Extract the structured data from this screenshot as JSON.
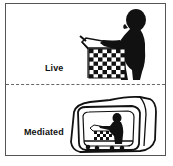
{
  "diagram": {
    "panels": [
      {
        "id": "live",
        "label": "Live",
        "illustration": "person-playing-chess-icon"
      },
      {
        "id": "mediated",
        "label": "Mediated",
        "illustration": "tv-screen-person-chess-icon"
      }
    ],
    "colors": {
      "border": "#555555",
      "divider": "#666666",
      "ink": "#111111",
      "background": "#ffffff"
    }
  }
}
